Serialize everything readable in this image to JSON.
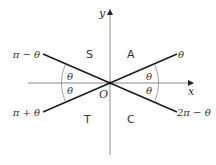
{
  "diagram": {
    "type": "quadrant-angle-diagram",
    "axes": {
      "x_label": "x",
      "y_label": "y",
      "origin_label": "O"
    },
    "quadrants": {
      "first": "A",
      "second": "S",
      "third": "T",
      "fourth": "C"
    },
    "ray_labels": {
      "first": "θ",
      "second": "π − θ",
      "third": "π + θ",
      "fourth": "2π − θ"
    },
    "angle_labels": {
      "left_upper": "θ",
      "left_lower": "θ",
      "right_upper": "θ",
      "right_lower": "θ"
    },
    "colors": {
      "axis": "#8a8a8a",
      "ray": "#1a1a1a",
      "arc": "#8a8a8a",
      "text": "#333333"
    }
  }
}
